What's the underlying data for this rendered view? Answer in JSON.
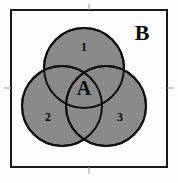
{
  "figure": {
    "title": "",
    "type": "venn-diagram",
    "universe": {
      "label": "B",
      "label_x": 142,
      "label_y": 35
    },
    "center_region": {
      "label": "A",
      "label_x": 84,
      "label_y": 90
    },
    "regions": [
      {
        "id": "region-1",
        "label": "1",
        "label_x": 84,
        "label_y": 48,
        "position": "top"
      },
      {
        "id": "region-2",
        "label": "2",
        "label_x": 48,
        "label_y": 118,
        "position": "bottom-left"
      },
      {
        "id": "region-3",
        "label": "3",
        "label_x": 120,
        "label_y": 118,
        "position": "bottom-right"
      }
    ],
    "circles": [
      {
        "id": "circle-top",
        "cx": 84,
        "cy": 68,
        "r": 40
      },
      {
        "id": "circle-bottom-left",
        "cx": 62,
        "cy": 106,
        "r": 40
      },
      {
        "id": "circle-bottom-right",
        "cx": 106,
        "cy": 106,
        "r": 40
      }
    ],
    "frame": {
      "x": 11,
      "y": 10,
      "width": 156,
      "height": 157
    },
    "colors": {
      "circle_fill": "#8a8a8a",
      "stroke": "#111111",
      "background": "#fdfdfd",
      "text": "#0a0a0a"
    }
  }
}
